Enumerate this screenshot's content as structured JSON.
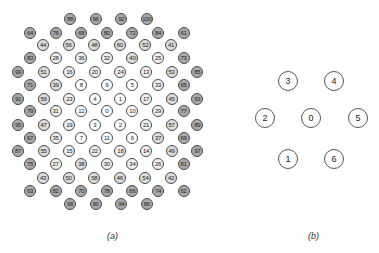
{
  "figure": {
    "panel_a": {
      "caption": "(a)",
      "rows": [
        {
          "y": 19,
          "x0": 70,
          "labels": [
            88,
            96,
            92,
            100
          ]
        },
        {
          "y": 33,
          "x0": 30,
          "labels": [
            64,
            76,
            68,
            80,
            72,
            84,
            61
          ]
        },
        {
          "y": 45,
          "x0": 43,
          "labels": [
            44,
            56,
            48,
            60,
            52,
            41
          ]
        },
        {
          "y": 58,
          "x0": 30,
          "labels": [
            83,
            28,
            36,
            32,
            40,
            25,
            73
          ]
        },
        {
          "y": 72,
          "x0": 18,
          "labels": [
            99,
            51,
            16,
            20,
            24,
            13,
            53,
            85
          ]
        },
        {
          "y": 85,
          "x0": 30,
          "labels": [
            71,
            39,
            8,
            9,
            5,
            33,
            65
          ]
        },
        {
          "y": 99,
          "x0": 18,
          "labels": [
            91,
            59,
            23,
            4,
            1,
            17,
            45,
            93
          ]
        },
        {
          "y": 111,
          "x0": 30,
          "labels": [
            79,
            31,
            12,
            0,
            10,
            29,
            77
          ]
        },
        {
          "y": 125,
          "x0": 18,
          "labels": [
            95,
            47,
            19,
            3,
            2,
            21,
            57,
            89
          ]
        },
        {
          "y": 138,
          "x0": 30,
          "labels": [
            67,
            35,
            7,
            11,
            6,
            37,
            69
          ]
        },
        {
          "y": 151,
          "x0": 18,
          "labels": [
            87,
            55,
            15,
            22,
            18,
            14,
            49,
            97
          ]
        },
        {
          "y": 164,
          "x0": 30,
          "labels": [
            75,
            27,
            38,
            30,
            34,
            26,
            81
          ]
        },
        {
          "y": 178,
          "x0": 43,
          "labels": [
            43,
            50,
            58,
            46,
            54,
            42
          ]
        },
        {
          "y": 191,
          "x0": 30,
          "labels": [
            63,
            82,
            70,
            78,
            66,
            74,
            62
          ]
        },
        {
          "y": 204,
          "x0": 70,
          "labels": [
            98,
            90,
            94,
            86
          ]
        }
      ],
      "col_spacing": 25.6
    },
    "panel_b": {
      "caption": "(b)",
      "nodes": [
        {
          "label": "3",
          "x": 288,
          "y": 81
        },
        {
          "label": "4",
          "x": 334,
          "y": 81
        },
        {
          "label": "2",
          "x": 265,
          "y": 118
        },
        {
          "label": "0",
          "x": 311,
          "y": 118
        },
        {
          "label": "5",
          "x": 358,
          "y": 118
        },
        {
          "label": "1",
          "x": 288,
          "y": 159
        },
        {
          "label": "6",
          "x": 334,
          "y": 159
        }
      ]
    },
    "shading": {
      "tier0_max": 12,
      "tier0_color": "#ffffff",
      "tier1_max": 36,
      "tier1_color": "#efefef",
      "tier2_max": 60,
      "tier2_color": "#dcdcdc",
      "tier3_color": "#a9a9a9"
    }
  }
}
